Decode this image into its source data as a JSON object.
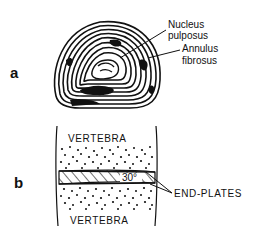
{
  "figure": {
    "panel_a": {
      "letter": "a",
      "labels": {
        "nucleus_line1": "Nucleus",
        "nucleus_line2": "pulposus",
        "annulus_line1": "Annulus",
        "annulus_line2": "fibrosus"
      }
    },
    "panel_b": {
      "letter": "b",
      "top_label": "VERTEBRA",
      "bottom_label": "VERTEBRA",
      "angle_label": "30°",
      "endplates_label": "END-PLATES"
    },
    "colors": {
      "ink": "#111111",
      "background": "#ffffff"
    }
  }
}
